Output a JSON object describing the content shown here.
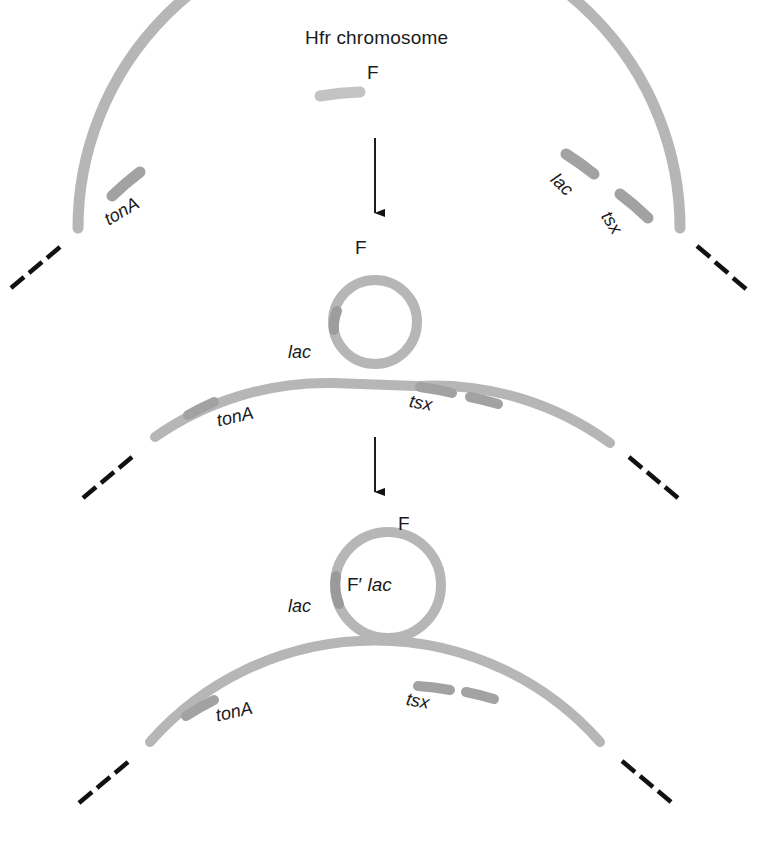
{
  "figure": {
    "title": "Hfr chromosome",
    "type": "biology-diagram",
    "colors": {
      "chromosome": "#b6b6b6",
      "gene_marker": "#9a9a9a",
      "text": "#1a1a1a",
      "arrow": "#111111",
      "dash": "#111111",
      "background": "#ffffff"
    }
  },
  "panels": {
    "top": {
      "name": "hfr-chromosome",
      "title": "Hfr chromosome",
      "f_label": "F",
      "genes": [
        {
          "label": "tonA",
          "italic": true
        },
        {
          "label": "lac",
          "italic": true
        },
        {
          "label": "tsx",
          "italic": true
        }
      ]
    },
    "middle": {
      "name": "looped-out-f-factor",
      "f_label": "F",
      "genes": [
        {
          "label": "lac",
          "italic": true
        },
        {
          "label": "tonA",
          "italic": true
        },
        {
          "label": "tsx",
          "italic": true
        }
      ]
    },
    "bottom": {
      "name": "f-prime-lac-plasmid",
      "f_label": "F",
      "plasmid_label_prefix": "F′",
      "plasmid_label_gene": "lac",
      "genes": [
        {
          "label": "lac",
          "italic": true
        },
        {
          "label": "tonA",
          "italic": true
        },
        {
          "label": "tsx",
          "italic": true
        }
      ]
    }
  },
  "arrows": [
    {
      "name": "arrow-top-to-middle",
      "direction": "down"
    },
    {
      "name": "arrow-middle-to-bottom",
      "direction": "down"
    }
  ]
}
